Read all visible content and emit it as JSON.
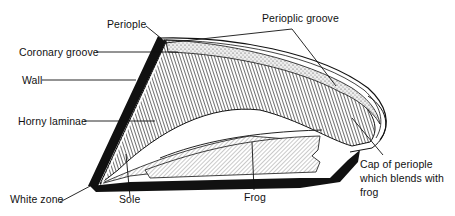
{
  "diagram": {
    "labels": {
      "periople": "Periople",
      "perioplic_groove": "Perioplic groove",
      "coronary_groove": "Coronary groove",
      "wall": "Wall",
      "horny_laminae": "Horny laminae",
      "white_zone": "White zone",
      "sole": "Sole",
      "frog": "Frog",
      "cap_of_periople_line1": "Cap of periople",
      "cap_of_periople_line2": "which blends with",
      "cap_of_periople_line3": "frog"
    },
    "colors": {
      "ink": "#111111",
      "background": "#ffffff",
      "hatch_light": "#d9d9d9"
    }
  }
}
